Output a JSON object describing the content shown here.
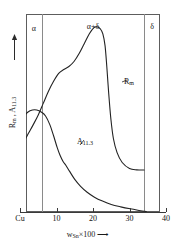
{
  "chart_data": {
    "type": "line",
    "title": "",
    "xlabel": "w_Sn x 100",
    "ylabel": "R_m , A_11.3",
    "xlim": [
      0,
      40
    ],
    "grid": false,
    "legend_position": "inline-curve-labels",
    "x_ticks": [
      {
        "label": "Cu",
        "value": 0
      },
      {
        "label": "10",
        "value": 10
      },
      {
        "label": "20",
        "value": 20
      },
      {
        "label": "30",
        "value": 30
      },
      {
        "label": "40",
        "value": 40
      }
    ],
    "phase_regions": [
      {
        "label": "α",
        "from": 0,
        "to": 6
      },
      {
        "label": "α+δ",
        "from": 6,
        "to": 34
      },
      {
        "label": "δ",
        "from": 34,
        "to": 40
      }
    ],
    "region_boundaries": [
      6,
      34
    ],
    "series": [
      {
        "name": "R_m",
        "label_main": "R",
        "label_sub": "m",
        "x": [
          0,
          1.2,
          2.4,
          3.6,
          5.0,
          6.4,
          7.8,
          9.2,
          10.6,
          12.0,
          13.4,
          14.8,
          16.2,
          17.6,
          19.0,
          20.2,
          21.2,
          22.0,
          22.7,
          23.3,
          23.8,
          24.3,
          24.9,
          25.6,
          26.6,
          28.0,
          30.0,
          32.0,
          34.0
        ],
        "y": [
          0.33,
          0.36,
          0.4,
          0.44,
          0.49,
          0.55,
          0.61,
          0.66,
          0.7,
          0.72,
          0.735,
          0.76,
          0.8,
          0.85,
          0.9,
          0.93,
          0.935,
          0.925,
          0.9,
          0.84,
          0.73,
          0.6,
          0.47,
          0.37,
          0.3,
          0.25,
          0.22,
          0.213,
          0.212
        ]
      },
      {
        "name": "A_11.3",
        "label_main": "A",
        "label_sub": "11.3",
        "x": [
          0,
          1.0,
          2.2,
          3.4,
          4.6,
          5.8,
          7.0,
          8.2,
          9.2,
          10.2,
          11.0,
          11.8,
          12.6,
          13.6,
          15.0,
          16.6,
          18.4,
          20.4,
          22.6,
          25.0,
          27.6,
          30.2,
          32.6,
          34.6
        ],
        "y": [
          0.44,
          0.48,
          0.505,
          0.515,
          0.515,
          0.505,
          0.485,
          0.44,
          0.385,
          0.325,
          0.285,
          0.255,
          0.235,
          0.205,
          0.165,
          0.13,
          0.1,
          0.075,
          0.055,
          0.038,
          0.026,
          0.016,
          0.008,
          0.002
        ]
      }
    ],
    "annotations": [
      {
        "text": "R_m",
        "x": 25.6,
        "y": 0.6
      },
      {
        "text": "A_11.3",
        "x": 15.2,
        "y": 0.3
      }
    ]
  },
  "axes": {
    "y_axis_label_main": "R",
    "y_axis_label_sub1": "m",
    "y_axis_label_sep": " , ",
    "y_axis_label_main2": "A",
    "y_axis_label_sub2": "11.3",
    "x_caption_main": "w",
    "x_caption_sub": "Sn",
    "x_caption_rest": "×100",
    "x_caption_arrow": "⟶"
  },
  "icons": {
    "y_arrow": "up-arrow-icon",
    "x_arrow": "right-arrow-icon"
  },
  "colors": {
    "curve": "#222222",
    "frame": "#5d5d5d",
    "divider": "#8a8a8a",
    "axis": "#3a3a3a",
    "background": "#ffffff"
  }
}
